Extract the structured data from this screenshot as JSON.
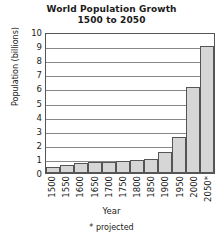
{
  "chart_data": {
    "type": "bar",
    "title": "World Population Growth",
    "subtitle": "1500 to 2050",
    "xlabel": "Year",
    "ylabel": "Population (billions)",
    "ylim": [
      0,
      10
    ],
    "ytick_step": 1,
    "ytick_labels": [
      "10",
      "9",
      "8",
      "7",
      "6",
      "5",
      "4",
      "3",
      "2",
      "1",
      "0"
    ],
    "grid": true,
    "legend": "none",
    "footnote": "* projected",
    "bar_fill_color": "#d6d6d6",
    "bar_edge_color": "#555555",
    "categories": [
      "1500",
      "1550",
      "1600",
      "1650",
      "1700",
      "1750",
      "1800",
      "1850",
      "1900",
      "1950",
      "2000",
      "2050*"
    ],
    "values": [
      0.45,
      0.6,
      0.7,
      0.75,
      0.78,
      0.82,
      0.9,
      0.98,
      1.5,
      2.55,
      6.1,
      9.0
    ]
  }
}
